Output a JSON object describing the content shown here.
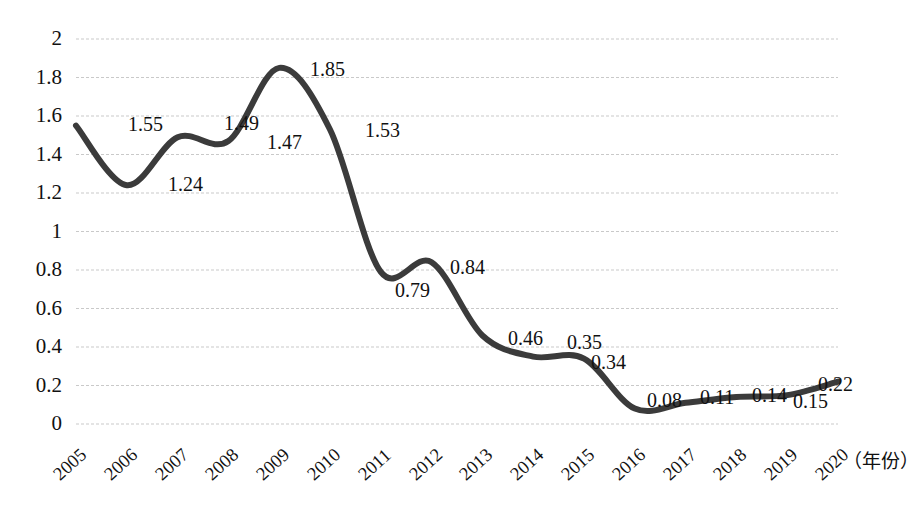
{
  "chart_data": {
    "type": "line",
    "title": "",
    "subtitle": "",
    "xlabel": "（年份）",
    "ylabel": "",
    "categories": [
      "2005",
      "2006",
      "2007",
      "2008",
      "2009",
      "2010",
      "2011",
      "2012",
      "2013",
      "2014",
      "2015",
      "2016",
      "2017",
      "2018",
      "2019",
      "2020"
    ],
    "values": [
      1.55,
      1.24,
      1.49,
      1.47,
      1.85,
      1.53,
      0.79,
      0.84,
      0.46,
      0.35,
      0.34,
      0.08,
      0.11,
      0.14,
      0.15,
      0.22
    ],
    "series": [
      {
        "name": "",
        "values": [
          1.55,
          1.24,
          1.49,
          1.47,
          1.85,
          1.53,
          0.79,
          0.84,
          0.46,
          0.35,
          0.34,
          0.08,
          0.11,
          0.14,
          0.15,
          0.22
        ]
      }
    ],
    "data_labels": [
      "1.55",
      "1.24",
      "1.49",
      "1.47",
      "1.85",
      "1.53",
      "0.79",
      "0.84",
      "0.46",
      "0.35",
      "0.34",
      "0.08",
      "0.11",
      "0.14",
      "0.15",
      "0.22"
    ],
    "ylim": [
      0,
      2
    ],
    "ytick_values": [
      0,
      0.2,
      0.4,
      0.6,
      0.8,
      1,
      1.2,
      1.4,
      1.6,
      1.8,
      2
    ],
    "ytick_labels": [
      "0",
      "0.2",
      "0.4",
      "0.6",
      "0.8",
      "1",
      "1.2",
      "1.4",
      "1.6",
      "1.8",
      "2"
    ],
    "grid": true,
    "grid_style": "dashed-horizontal",
    "legend": false,
    "legend_position": "none",
    "line_color": "#3b3b3b",
    "line_width": 6,
    "smoothing": "spline",
    "markers": false,
    "background_color": "#ffffff",
    "grid_color": "#c9c9c9",
    "text_color": "#111111"
  },
  "axes": {
    "y_ticks": [
      {
        "label": "2",
        "value": 2
      },
      {
        "label": "1.8",
        "value": 1.8
      },
      {
        "label": "1.6",
        "value": 1.6
      },
      {
        "label": "1.4",
        "value": 1.4
      },
      {
        "label": "1.2",
        "value": 1.2
      },
      {
        "label": "1",
        "value": 1
      },
      {
        "label": "0.8",
        "value": 0.8
      },
      {
        "label": "0.6",
        "value": 0.6
      },
      {
        "label": "0.4",
        "value": 0.4
      },
      {
        "label": "0.2",
        "value": 0.2
      },
      {
        "label": "0",
        "value": 0
      }
    ],
    "x_ticks": [
      {
        "label": "2005"
      },
      {
        "label": "2006"
      },
      {
        "label": "2007"
      },
      {
        "label": "2008"
      },
      {
        "label": "2009"
      },
      {
        "label": "2010"
      },
      {
        "label": "2011"
      },
      {
        "label": "2012"
      },
      {
        "label": "2013"
      },
      {
        "label": "2014"
      },
      {
        "label": "2015"
      },
      {
        "label": "2016"
      },
      {
        "label": "2017"
      },
      {
        "label": "2018"
      },
      {
        "label": "2019"
      },
      {
        "label": "2020"
      }
    ],
    "x_unit_note": "（年份）"
  },
  "annotations": {
    "labels": [
      {
        "text": "1.55",
        "x": 128,
        "y": 114
      },
      {
        "text": "1.24",
        "x": 168,
        "y": 174
      },
      {
        "text": "1.49",
        "x": 224,
        "y": 113
      },
      {
        "text": "1.47",
        "x": 267,
        "y": 132
      },
      {
        "text": "1.85",
        "x": 310,
        "y": 59
      },
      {
        "text": "1.53",
        "x": 365,
        "y": 120
      },
      {
        "text": "0.79",
        "x": 395,
        "y": 280
      },
      {
        "text": "0.84",
        "x": 450,
        "y": 257
      },
      {
        "text": "0.46",
        "x": 508,
        "y": 328
      },
      {
        "text": "0.35",
        "x": 567,
        "y": 332
      },
      {
        "text": "0.34",
        "x": 591,
        "y": 352
      },
      {
        "text": "0.08",
        "x": 647,
        "y": 390
      },
      {
        "text": "0.11",
        "x": 700,
        "y": 387
      },
      {
        "text": "0.14",
        "x": 752,
        "y": 385
      },
      {
        "text": "0.15",
        "x": 793,
        "y": 391
      },
      {
        "text": "0.22",
        "x": 818,
        "y": 374
      }
    ]
  }
}
